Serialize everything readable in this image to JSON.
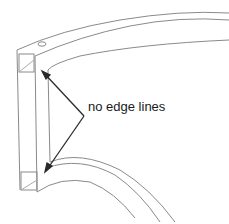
{
  "figure": {
    "annotation": "no edge lines",
    "colors": {
      "background": "#ffffff",
      "edge_line": "#8a8a8a",
      "arrow": "#2a2a2a",
      "text": "#1a1a1a"
    }
  }
}
